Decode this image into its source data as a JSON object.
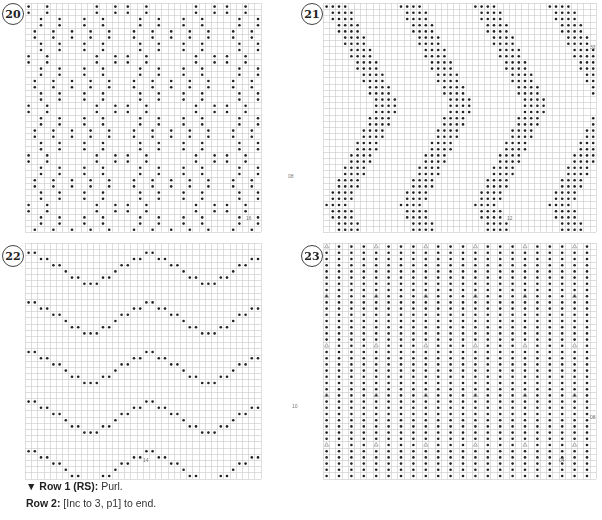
{
  "charts": [
    {
      "number": "20",
      "pattern": "diamond-dots",
      "row_label": "08",
      "stitch_label": "16",
      "cols": 38,
      "rows": 37
    },
    {
      "number": "21",
      "pattern": "chevron-zigzag",
      "row_label": "32",
      "stitch_label": "12",
      "cols": 44,
      "rows": 37
    },
    {
      "number": "22",
      "pattern": "wave-lines",
      "row_label": "10",
      "stitch_label": "14",
      "cols": 38,
      "rows": 38
    },
    {
      "number": "23",
      "pattern": "all-over-dots-with-increase",
      "row_label": "08",
      "stitch_label": "04",
      "cols": 44,
      "rows": 38
    }
  ],
  "instructions": {
    "row1_label": "Row 1 (RS):",
    "row1_text": " Purl.",
    "row2_label": "Row 2:",
    "row2_text": " [Inc to 3, p1] to end."
  },
  "colors": {
    "grid_line": "#c8c8c8",
    "dot": "#222222",
    "increase_symbol": "#999999"
  }
}
